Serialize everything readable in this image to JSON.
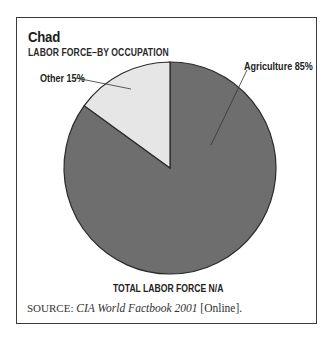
{
  "title": "Chad",
  "subtitle": "LABOR FORCE–BY OCCUPATION",
  "footer_total": "TOTAL LABOR FORCE N/A",
  "source": {
    "prefix": "SOURCE:",
    "title": "CIA World Factbook 2001",
    "suffix": "[Online]."
  },
  "labels": {
    "agriculture": "Agriculture 85%",
    "other": "Other 15%"
  },
  "colors": {
    "agriculture": "#6e6e6e",
    "other": "#e6e6e6",
    "outline": "#2a2a2a"
  },
  "chart_data": {
    "type": "pie",
    "title": "Chad",
    "subtitle": "LABOR FORCE–BY OCCUPATION",
    "categories": [
      "Agriculture",
      "Other"
    ],
    "values": [
      85,
      15
    ],
    "unit": "%",
    "start_angle": "12 o'clock, Other slice drawn counter-clockwise from top",
    "labels": [
      "Agriculture 85%",
      "Other 15%"
    ],
    "annotation": "TOTAL LABOR FORCE N/A",
    "source": "SOURCE: CIA World Factbook 2001 [Online].",
    "legend": "none (leader-line labels)"
  }
}
